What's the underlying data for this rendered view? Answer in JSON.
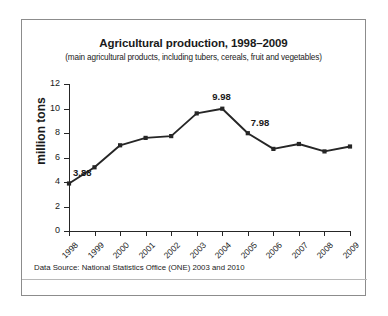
{
  "chart_data": {
    "type": "line",
    "title": "Agricultural production, 1998–2009",
    "subtitle": "(main agricultural products, including tubers, cereals, fruit and vegetables)",
    "xlabel": "",
    "ylabel": "million tons",
    "categories": [
      "1998",
      "1999",
      "2000",
      "2001",
      "2002",
      "2003",
      "2004",
      "2005",
      "2006",
      "2007",
      "2008",
      "2009"
    ],
    "values": [
      3.88,
      5.2,
      7.0,
      7.6,
      7.75,
      9.6,
      9.98,
      7.98,
      6.7,
      7.1,
      6.5,
      6.9
    ],
    "point_labels": [
      {
        "category": "1998",
        "text": "3.88"
      },
      {
        "category": "2004",
        "text": "9.98"
      },
      {
        "category": "2005",
        "text": "7.98"
      }
    ],
    "ylim": [
      0,
      12
    ],
    "yticks": [
      0,
      2,
      4,
      6,
      8,
      10,
      12
    ],
    "grid": false,
    "legend": false,
    "series_color": "#262626",
    "marker": "square"
  },
  "source_note": "Data Source: National Statistics Office (ONE) 2003 and 2010"
}
